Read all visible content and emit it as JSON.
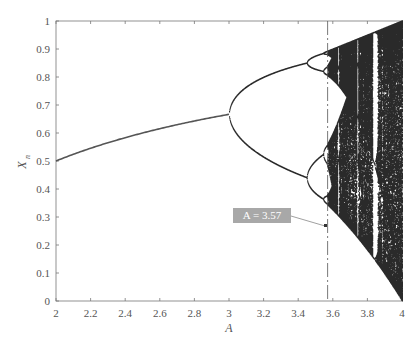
{
  "chart_data": {
    "type": "scatter",
    "title": "",
    "subtitle": "Bifurcation diagram of the logistic map",
    "xlabel": "A",
    "ylabel": "X_n",
    "xlim": [
      2,
      4
    ],
    "ylim": [
      0,
      1
    ],
    "xticks": [
      "2",
      "2.2",
      "2.4",
      "2.6",
      "2.8",
      "3",
      "3.2",
      "3.4",
      "3.6",
      "3.8",
      "4"
    ],
    "yticks": [
      "0",
      "0.1",
      "0.2",
      "0.3",
      "0.4",
      "0.5",
      "0.6",
      "0.7",
      "0.8",
      "0.9",
      "1"
    ],
    "grid": false,
    "legend": null,
    "series": [
      {
        "name": "period-1 branch",
        "x": [
          2.0,
          2.2,
          2.4,
          2.6,
          2.8,
          3.0
        ],
        "values": [
          0.5,
          0.545,
          0.583,
          0.615,
          0.643,
          0.667
        ]
      },
      {
        "name": "period-2 upper",
        "x": [
          3.0,
          3.1,
          3.2,
          3.3,
          3.449
        ],
        "values": [
          0.667,
          0.765,
          0.799,
          0.824,
          0.852
        ]
      },
      {
        "name": "period-2 lower",
        "x": [
          3.0,
          3.1,
          3.2,
          3.3,
          3.449
        ],
        "values": [
          0.667,
          0.558,
          0.513,
          0.479,
          0.44
        ]
      },
      {
        "name": "chaotic region",
        "x_range": [
          3.57,
          4.0
        ],
        "y_upper_at_4": 1.0,
        "y_lower_at_4": 0.0
      }
    ],
    "annotations": [
      {
        "text": "A = 3.57",
        "x": 3.57,
        "y": 0.36,
        "style": "grey box with arrow"
      },
      {
        "type": "vertical dashed line",
        "x": 3.57
      }
    ],
    "periodic_windows_visible": [
      3.63,
      3.74,
      3.83
    ]
  },
  "labels": {
    "xaxis_title": "A",
    "yaxis_title_main": "X",
    "yaxis_title_sub": "n",
    "annotation": "A = 3.57"
  },
  "colors": {
    "curve": "#555555",
    "chaos_fill": "#1a1a1a",
    "axis": "#777777",
    "annotation_box": "#a8a8a8",
    "annotation_text": "#ffffff"
  }
}
